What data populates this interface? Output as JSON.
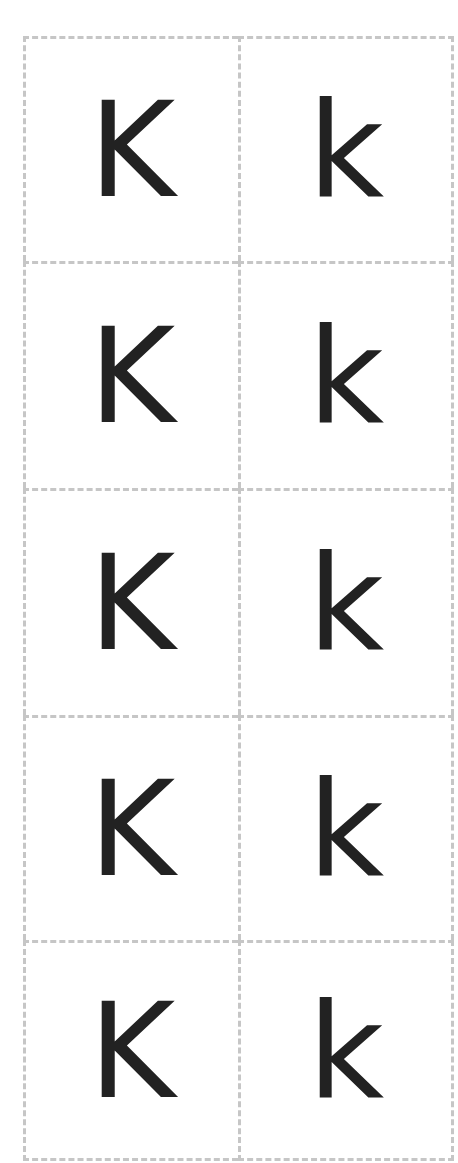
{
  "cards": {
    "rows": [
      {
        "upper": "K",
        "lower": "k"
      },
      {
        "upper": "K",
        "lower": "k"
      },
      {
        "upper": "K",
        "lower": "k"
      },
      {
        "upper": "K",
        "lower": "k"
      },
      {
        "upper": "K",
        "lower": "k"
      }
    ]
  },
  "style": {
    "border_color": "#c6c6c6",
    "letter_color": "#222222"
  }
}
